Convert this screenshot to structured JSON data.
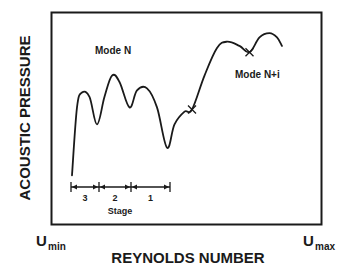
{
  "chart_data": {
    "type": "line",
    "title": "",
    "xlabel": "REYNOLDS NUMBER",
    "ylabel": "ACOUSTIC PRESSURE",
    "x_tick_labels": [
      {
        "base": "U",
        "sub": "min"
      },
      {
        "base": "U",
        "sub": "max"
      }
    ],
    "grid": false,
    "legend": null,
    "annotations": [
      {
        "text": "Mode N",
        "near": "upper-left"
      },
      {
        "text": "Mode N+i",
        "near": "upper-right"
      }
    ],
    "stages": {
      "label": "Stage",
      "segments": [
        "3",
        "2",
        "1"
      ]
    },
    "series": [
      {
        "name": "acoustic-pressure-curve",
        "description": "Qualitative normalized curve (x: 0=Umin..1=Umax, y: 0=bottom..1=top)",
        "points": [
          [
            0.0,
            0.23
          ],
          [
            0.02,
            0.55
          ],
          [
            0.04,
            0.62
          ],
          [
            0.07,
            0.6
          ],
          [
            0.1,
            0.47
          ],
          [
            0.13,
            0.6
          ],
          [
            0.16,
            0.7
          ],
          [
            0.19,
            0.67
          ],
          [
            0.23,
            0.55
          ],
          [
            0.26,
            0.63
          ],
          [
            0.3,
            0.64
          ],
          [
            0.34,
            0.55
          ],
          [
            0.38,
            0.36
          ],
          [
            0.41,
            0.47
          ],
          [
            0.45,
            0.53
          ],
          [
            0.48,
            0.54
          ],
          [
            0.53,
            0.7
          ],
          [
            0.58,
            0.83
          ],
          [
            0.62,
            0.86
          ],
          [
            0.67,
            0.84
          ],
          [
            0.71,
            0.81
          ],
          [
            0.75,
            0.88
          ],
          [
            0.79,
            0.9
          ],
          [
            0.82,
            0.88
          ],
          [
            0.84,
            0.84
          ]
        ],
        "cross_marks": [
          [
            0.48,
            0.54
          ],
          [
            0.71,
            0.81
          ]
        ]
      }
    ]
  }
}
